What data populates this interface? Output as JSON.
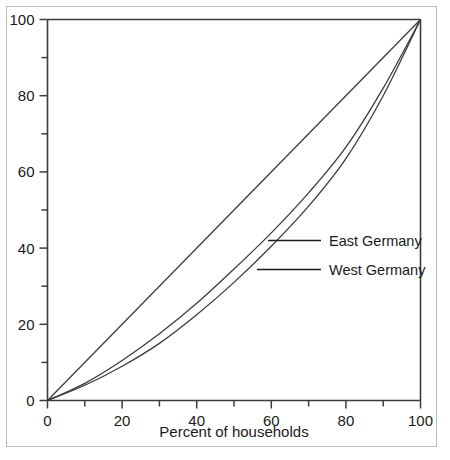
{
  "chart_data": {
    "type": "line",
    "title": "",
    "subtitle": "",
    "xlabel": "Percent of households",
    "ylabel": "",
    "xlim": [
      0,
      100
    ],
    "ylim": [
      0,
      100
    ],
    "grid": false,
    "legend_position": "inside-right",
    "x_ticks": [
      0,
      20,
      40,
      60,
      80,
      100
    ],
    "x_tick_labels": [
      "0",
      "20",
      "40",
      "60",
      "80",
      "100"
    ],
    "x_minor_ticks": [
      10,
      30,
      50,
      70,
      90
    ],
    "y_ticks": [
      0,
      20,
      40,
      60,
      80,
      100
    ],
    "y_tick_labels": [
      "0",
      "20",
      "40",
      "60",
      "80",
      "100"
    ],
    "y_minor_ticks": [
      10,
      30,
      50,
      70,
      90
    ],
    "x": [
      0,
      10,
      20,
      30,
      40,
      50,
      60,
      70,
      80,
      90,
      100
    ],
    "series": [
      {
        "name": "Line of equality",
        "labelled": false,
        "values": [
          0,
          10,
          20,
          30,
          40,
          50,
          60,
          70,
          80,
          90,
          100
        ]
      },
      {
        "name": "East Germany",
        "labelled": true,
        "values": [
          0,
          4.5,
          10.5,
          17.5,
          25.5,
          34.5,
          44.0,
          54.5,
          66.5,
          82.0,
          100
        ]
      },
      {
        "name": "West Germany",
        "labelled": true,
        "values": [
          0,
          4.0,
          9.0,
          15.0,
          22.5,
          31.0,
          40.5,
          51.0,
          63.5,
          80.0,
          100
        ]
      }
    ]
  },
  "legend": {
    "entries": [
      {
        "label": "East Germany"
      },
      {
        "label": "West Germany"
      }
    ]
  },
  "axes": {
    "x_axis_label": "Percent of households"
  }
}
